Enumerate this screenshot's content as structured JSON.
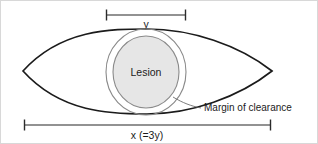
{
  "figure": {
    "labels": {
      "lesion": "Lesion",
      "margin_of_clearance": "Margin of clearance",
      "short_axis": "y",
      "long_axis": "x (=3y)"
    },
    "colors": {
      "background": "#ffffff",
      "frame_border": "#d8d8d8",
      "excision_outline": "#1b1b1b",
      "margin_outline": "#8a8a8a",
      "lesion_fill": "#e6e6e6",
      "lesion_outline": "#8a8a8a",
      "dimension_line": "#6e6e6e",
      "leader_line": "#6e6e6e",
      "text": "#1b1b1b"
    },
    "geometry": {
      "ellipse_left_tip_x": 22,
      "ellipse_right_tip_x": 271,
      "ellipse_center_y": 70,
      "ellipse_top_y": 28,
      "ellipse_bottom_y": 113,
      "lesion_center_x": 145,
      "lesion_center_y": 71,
      "lesion_rx": 33,
      "lesion_ry": 36,
      "margin_rx": 40,
      "margin_ry": 43,
      "y_dimension_left_x": 105,
      "y_dimension_right_x": 185,
      "y_dimension_y": 14,
      "x_dimension_left_x": 23,
      "x_dimension_right_x": 270,
      "x_dimension_y": 124
    }
  }
}
